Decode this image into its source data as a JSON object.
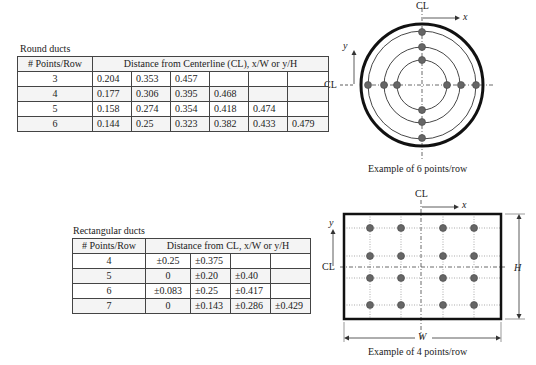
{
  "round": {
    "title": "Round ducts",
    "header": [
      "# Points/Row",
      "Distance from Centerline (CL), x/W or y/H"
    ],
    "rows": [
      {
        "n": "3",
        "v": [
          "0.204",
          "0.353",
          "0.457",
          "",
          "",
          ""
        ]
      },
      {
        "n": "4",
        "v": [
          "0.177",
          "0.306",
          "0.395",
          "0.468",
          "",
          ""
        ]
      },
      {
        "n": "5",
        "v": [
          "0.158",
          "0.274",
          "0.354",
          "0.418",
          "0.474",
          ""
        ]
      },
      {
        "n": "6",
        "v": [
          "0.144",
          "0.25",
          "0.323",
          "0.382",
          "0.433",
          "0.479"
        ]
      }
    ],
    "figure": {
      "cl": "CL",
      "x": "x",
      "y": "y",
      "caption": "Example of 6 points/row"
    }
  },
  "rect": {
    "title": "Rectangular ducts",
    "header": [
      "# Points/Row",
      "Distance from CL, x/W or y/H"
    ],
    "rows": [
      {
        "n": "4",
        "v": [
          "±0.25",
          "±0.375",
          "",
          ""
        ]
      },
      {
        "n": "5",
        "v": [
          "0",
          "±0.20",
          "±0.40",
          ""
        ]
      },
      {
        "n": "6",
        "v": [
          "±0.083",
          "±0.25",
          "±0.417",
          ""
        ]
      },
      {
        "n": "7",
        "v": [
          "0",
          "±0.143",
          "±0.286",
          "±0.429"
        ]
      }
    ],
    "figure": {
      "cl": "CL",
      "x": "x",
      "y": "y",
      "h": "H",
      "w": "W",
      "caption": "Example of 4 points/row"
    }
  }
}
